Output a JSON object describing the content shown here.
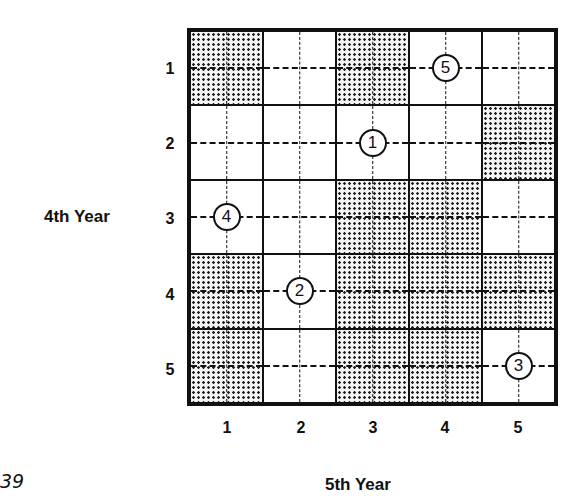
{
  "diagram": {
    "row_axis_label": "4th Year",
    "col_axis_label": "5th Year",
    "row_labels": [
      "1",
      "2",
      "3",
      "4",
      "5"
    ],
    "col_labels": [
      "1",
      "2",
      "3",
      "4",
      "5"
    ],
    "page_number_fragment": "39",
    "legend": {
      "shaded": "dotted fill",
      "white": "empty"
    },
    "rows": [
      {
        "cells": [
          {
            "shaded": true,
            "marker": ""
          },
          {
            "shaded": false,
            "marker": ""
          },
          {
            "shaded": true,
            "marker": ""
          },
          {
            "shaded": false,
            "marker": "5"
          },
          {
            "shaded": false,
            "marker": ""
          }
        ]
      },
      {
        "cells": [
          {
            "shaded": false,
            "marker": ""
          },
          {
            "shaded": false,
            "marker": ""
          },
          {
            "shaded": false,
            "marker": "1"
          },
          {
            "shaded": false,
            "marker": ""
          },
          {
            "shaded": true,
            "marker": ""
          }
        ]
      },
      {
        "cells": [
          {
            "shaded": false,
            "marker": "4"
          },
          {
            "shaded": false,
            "marker": ""
          },
          {
            "shaded": true,
            "marker": ""
          },
          {
            "shaded": true,
            "marker": ""
          },
          {
            "shaded": false,
            "marker": ""
          }
        ]
      },
      {
        "cells": [
          {
            "shaded": true,
            "marker": ""
          },
          {
            "shaded": false,
            "marker": "2"
          },
          {
            "shaded": true,
            "marker": ""
          },
          {
            "shaded": true,
            "marker": ""
          },
          {
            "shaded": true,
            "marker": ""
          }
        ]
      },
      {
        "cells": [
          {
            "shaded": true,
            "marker": ""
          },
          {
            "shaded": false,
            "marker": ""
          },
          {
            "shaded": true,
            "marker": ""
          },
          {
            "shaded": true,
            "marker": ""
          },
          {
            "shaded": false,
            "marker": "3"
          }
        ]
      }
    ],
    "colors": {
      "ink": "#111111",
      "background": "#ffffff"
    }
  }
}
